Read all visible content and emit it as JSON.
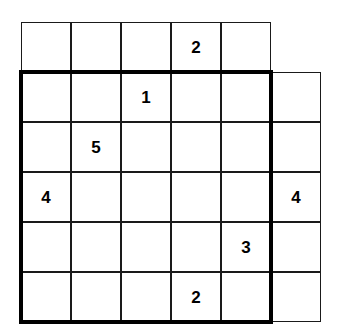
{
  "puzzle": {
    "title": "Number Placement Puzzle Grid",
    "grid": {
      "columns": 6,
      "rows": 6,
      "cell_size": 50,
      "origin_x": 21,
      "origin_y": 22,
      "line_color": "#1a1a1a",
      "background_color": "#ffffff"
    },
    "region": {
      "name": "bold-outlined-region",
      "border_color": "#000000",
      "border_width": 4,
      "start_row": 2,
      "end_row": 6,
      "start_col": 1,
      "end_col": 5
    },
    "cells": [
      {
        "row": 1,
        "col": 1,
        "value": ""
      },
      {
        "row": 1,
        "col": 2,
        "value": ""
      },
      {
        "row": 1,
        "col": 3,
        "value": ""
      },
      {
        "row": 1,
        "col": 4,
        "value": "2"
      },
      {
        "row": 1,
        "col": 5,
        "value": ""
      },
      {
        "row": 2,
        "col": 1,
        "value": ""
      },
      {
        "row": 2,
        "col": 2,
        "value": ""
      },
      {
        "row": 2,
        "col": 3,
        "value": "1"
      },
      {
        "row": 2,
        "col": 4,
        "value": ""
      },
      {
        "row": 2,
        "col": 5,
        "value": ""
      },
      {
        "row": 2,
        "col": 6,
        "value": ""
      },
      {
        "row": 3,
        "col": 1,
        "value": ""
      },
      {
        "row": 3,
        "col": 2,
        "value": "5"
      },
      {
        "row": 3,
        "col": 3,
        "value": ""
      },
      {
        "row": 3,
        "col": 4,
        "value": ""
      },
      {
        "row": 3,
        "col": 5,
        "value": ""
      },
      {
        "row": 3,
        "col": 6,
        "value": ""
      },
      {
        "row": 4,
        "col": 1,
        "value": "4"
      },
      {
        "row": 4,
        "col": 2,
        "value": ""
      },
      {
        "row": 4,
        "col": 3,
        "value": ""
      },
      {
        "row": 4,
        "col": 4,
        "value": ""
      },
      {
        "row": 4,
        "col": 5,
        "value": ""
      },
      {
        "row": 4,
        "col": 6,
        "value": "4"
      },
      {
        "row": 5,
        "col": 1,
        "value": ""
      },
      {
        "row": 5,
        "col": 2,
        "value": ""
      },
      {
        "row": 5,
        "col": 3,
        "value": ""
      },
      {
        "row": 5,
        "col": 4,
        "value": ""
      },
      {
        "row": 5,
        "col": 5,
        "value": "3"
      },
      {
        "row": 5,
        "col": 6,
        "value": ""
      },
      {
        "row": 6,
        "col": 1,
        "value": ""
      },
      {
        "row": 6,
        "col": 2,
        "value": ""
      },
      {
        "row": 6,
        "col": 3,
        "value": ""
      },
      {
        "row": 6,
        "col": 4,
        "value": "2"
      },
      {
        "row": 6,
        "col": 5,
        "value": ""
      },
      {
        "row": 6,
        "col": 6,
        "value": ""
      }
    ]
  }
}
